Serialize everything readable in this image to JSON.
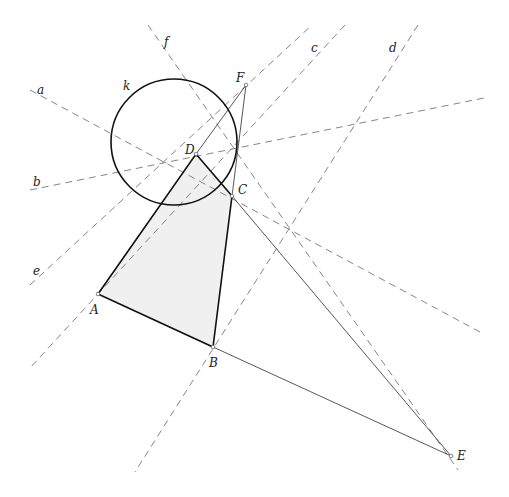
{
  "diagram": {
    "type": "geometric-construction",
    "colors": {
      "background": "#ffffff",
      "fill": "#f0f0f0",
      "solid_line": "#111111",
      "thin_line": "#444444",
      "dashed_line": "#777777",
      "label": "#222222"
    },
    "points": [
      {
        "name": "A",
        "x": 98,
        "y": 294,
        "label_dx": -8,
        "label_dy": 20
      },
      {
        "name": "B",
        "x": 213,
        "y": 347,
        "label_dx": -4,
        "label_dy": 20
      },
      {
        "name": "C",
        "x": 232,
        "y": 196,
        "label_dx": 6,
        "label_dy": -2
      },
      {
        "name": "D",
        "x": 196,
        "y": 154,
        "label_dx": -11,
        "label_dy": 0
      },
      {
        "name": "E",
        "x": 451,
        "y": 456,
        "label_dx": 6,
        "label_dy": 4
      },
      {
        "name": "F",
        "x": 246,
        "y": 85,
        "label_dx": -10,
        "label_dy": -3
      }
    ],
    "polygon": {
      "name": "ABCD",
      "vertices": [
        "A",
        "B",
        "C",
        "D"
      ]
    },
    "segments_thin": [
      {
        "from": "B",
        "to": "E"
      },
      {
        "from": "C",
        "to": "E"
      },
      {
        "from": "D",
        "to": "F"
      },
      {
        "from": "C",
        "to": "F"
      }
    ],
    "circle": {
      "name": "k",
      "cx": 174,
      "cy": 142,
      "r": 63,
      "label_x": 123,
      "label_y": 90
    },
    "dashed_lines": [
      {
        "name": "a",
        "x1": 30,
        "y1": 90,
        "x2": 480,
        "y2": 332,
        "label_x": 37,
        "label_y": 94
      },
      {
        "name": "b",
        "x1": 30,
        "y1": 190,
        "x2": 484,
        "y2": 98,
        "label_x": 33,
        "label_y": 186
      },
      {
        "name": "c",
        "x1": 345,
        "y1": 25,
        "x2": 30,
        "y2": 368,
        "label_x": 311,
        "label_y": 52
      },
      {
        "name": "d",
        "x1": 418,
        "y1": 25,
        "x2": 135,
        "y2": 472,
        "label_x": 389,
        "label_y": 52
      },
      {
        "name": "e",
        "x1": 30,
        "y1": 285,
        "x2": 312,
        "y2": 25,
        "label_x": 33,
        "label_y": 275
      },
      {
        "name": "f",
        "x1": 148,
        "y1": 25,
        "x2": 458,
        "y2": 470,
        "label_x": 164,
        "label_y": 46
      }
    ]
  }
}
